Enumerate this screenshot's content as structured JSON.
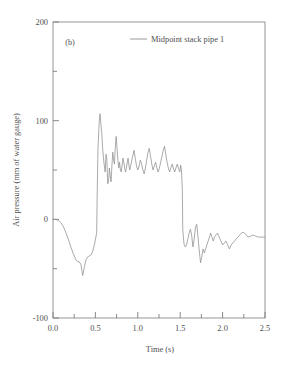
{
  "chart_data": {
    "type": "line",
    "title": "",
    "panel_label": "(b)",
    "xlabel": "Time (s)",
    "ylabel": "Air pressure (mm of water gauge)",
    "xlim": [
      0.0,
      2.5
    ],
    "ylim": [
      -100,
      200
    ],
    "grid": false,
    "legend_position": "top-center",
    "x_major_ticks": [
      0.0,
      0.5,
      1.0,
      1.5,
      2.0,
      2.5
    ],
    "x_major_tick_labels": [
      "0.0",
      "0.5",
      "1.0",
      "1.5",
      "2.0",
      "2.5"
    ],
    "x_minor_ticks": [
      0.25,
      0.75,
      1.25,
      1.75,
      2.25
    ],
    "y_major_ticks": [
      -100,
      0,
      100,
      200
    ],
    "y_major_tick_labels": [
      "-100",
      "0",
      "100",
      "200"
    ],
    "y_minor_ticks": [
      -50,
      50,
      150
    ],
    "series": [
      {
        "name": "Midpoint stack pipe 1",
        "color": "#8e8e8e",
        "x": [
          0.0,
          0.03,
          0.06,
          0.09,
          0.12,
          0.15,
          0.18,
          0.21,
          0.24,
          0.27,
          0.29,
          0.31,
          0.33,
          0.35,
          0.37,
          0.39,
          0.41,
          0.43,
          0.45,
          0.47,
          0.49,
          0.51,
          0.515,
          0.52,
          0.53,
          0.545,
          0.555,
          0.565,
          0.575,
          0.585,
          0.6,
          0.615,
          0.625,
          0.635,
          0.645,
          0.655,
          0.665,
          0.675,
          0.685,
          0.695,
          0.705,
          0.715,
          0.725,
          0.735,
          0.745,
          0.755,
          0.765,
          0.775,
          0.785,
          0.795,
          0.805,
          0.815,
          0.825,
          0.835,
          0.845,
          0.855,
          0.865,
          0.875,
          0.885,
          0.895,
          0.905,
          0.915,
          0.925,
          0.94,
          0.955,
          0.97,
          0.985,
          1.0,
          1.015,
          1.03,
          1.045,
          1.06,
          1.075,
          1.09,
          1.105,
          1.12,
          1.135,
          1.15,
          1.165,
          1.18,
          1.195,
          1.21,
          1.225,
          1.24,
          1.255,
          1.27,
          1.285,
          1.3,
          1.315,
          1.33,
          1.345,
          1.36,
          1.375,
          1.39,
          1.405,
          1.42,
          1.435,
          1.45,
          1.465,
          1.48,
          1.495,
          1.505,
          1.515,
          1.525,
          1.53,
          1.545,
          1.56,
          1.575,
          1.59,
          1.605,
          1.62,
          1.635,
          1.65,
          1.665,
          1.68,
          1.695,
          1.71,
          1.725,
          1.74,
          1.755,
          1.77,
          1.785,
          1.8,
          1.815,
          1.83,
          1.845,
          1.86,
          1.875,
          1.89,
          1.905,
          1.92,
          1.94,
          1.96,
          1.98,
          2.0,
          2.02,
          2.04,
          2.06,
          2.08,
          2.1,
          2.12,
          2.14,
          2.16,
          2.18,
          2.2,
          2.22,
          2.24,
          2.26,
          2.28,
          2.3,
          2.33,
          2.36,
          2.39,
          2.42,
          2.45,
          2.48,
          2.5
        ],
        "y": [
          0,
          0,
          -1,
          -3,
          -7,
          -13,
          -20,
          -28,
          -35,
          -41,
          -43,
          -43,
          -46,
          -57,
          -48,
          -41,
          -38,
          -37,
          -36,
          -32,
          -25,
          -16,
          -14,
          20,
          70,
          100,
          107,
          96,
          88,
          72,
          58,
          48,
          66,
          61,
          36,
          38,
          52,
          44,
          38,
          55,
          68,
          60,
          56,
          74,
          84,
          72,
          60,
          52,
          58,
          50,
          48,
          55,
          62,
          58,
          52,
          48,
          52,
          57,
          62,
          55,
          50,
          54,
          58,
          64,
          70,
          62,
          54,
          50,
          54,
          60,
          56,
          50,
          46,
          52,
          60,
          68,
          72,
          64,
          56,
          50,
          54,
          58,
          52,
          48,
          52,
          58,
          64,
          70,
          74,
          66,
          58,
          52,
          48,
          52,
          56,
          52,
          48,
          52,
          56,
          52,
          48,
          55,
          50,
          30,
          -10,
          -25,
          -28,
          -26,
          -20,
          -14,
          -10,
          -16,
          -28,
          -20,
          -8,
          -5,
          -18,
          -32,
          -44,
          -38,
          -30,
          -34,
          -30,
          -26,
          -22,
          -18,
          -14,
          -18,
          -22,
          -18,
          -16,
          -14,
          -18,
          -22,
          -26,
          -24,
          -22,
          -26,
          -30,
          -26,
          -24,
          -22,
          -20,
          -18,
          -16,
          -14,
          -13,
          -14,
          -16,
          -18,
          -17,
          -16,
          -17,
          -18,
          -18,
          -18,
          -18
        ]
      }
    ]
  },
  "legend": {
    "entries": [
      {
        "label": "Midpoint stack pipe 1"
      }
    ]
  }
}
